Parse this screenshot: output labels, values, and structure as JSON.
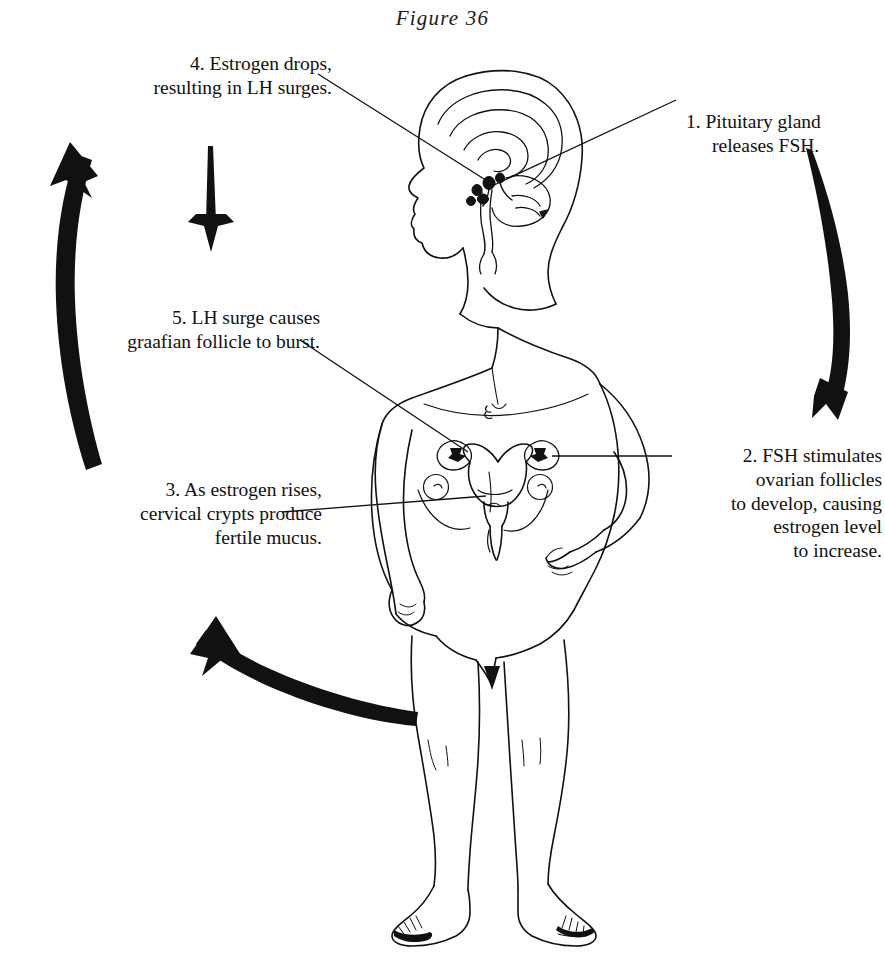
{
  "figure": {
    "title": "Figure 36",
    "background_color": "#ffffff",
    "ink_color": "#111111"
  },
  "callouts": [
    {
      "id": "callout-1",
      "number": "1.",
      "line1": "1.  Pituitary gland",
      "line2": "releases FSH.",
      "full_text": "1. Pituitary gland releases FSH.",
      "align": "left",
      "points_to": "pituitary-gland"
    },
    {
      "id": "callout-2",
      "number": "2.",
      "full_text": "2.  FSH stimulates\novarian follicles\nto develop, causing\nestrogen level\nto increase.",
      "align": "right",
      "points_to": "right-ovary"
    },
    {
      "id": "callout-3",
      "number": "3.",
      "full_text": "3.  As estrogen rises,\ncervical crypts produce\nfertile mucus.",
      "align": "right",
      "points_to": "cervix"
    },
    {
      "id": "callout-4",
      "number": "4.",
      "full_text": "4.  Estrogen drops,\nresulting in LH surges.",
      "align": "right",
      "points_to": "pituitary-gland"
    },
    {
      "id": "callout-5",
      "number": "5.",
      "full_text": "5.  LH surge causes\ngraafian follicle to burst.",
      "align": "right",
      "points_to": "left-ovary"
    }
  ],
  "cycle_arrows": [
    {
      "name": "arrow-right-descending",
      "direction": "down",
      "side": "right"
    },
    {
      "name": "arrow-bottom-left-sweeping",
      "direction": "up-left",
      "side": "bottom"
    },
    {
      "name": "arrow-left-ascending",
      "direction": "up",
      "side": "left"
    },
    {
      "name": "arrow-top-small-down",
      "direction": "down",
      "side": "top-left"
    }
  ],
  "anatomy_parts": [
    "head-profile",
    "brain-cross-section",
    "pituitary-gland",
    "torso",
    "left-arm",
    "right-arm-on-hip",
    "uterus",
    "left-ovary",
    "right-ovary",
    "cervix",
    "legs",
    "feet"
  ]
}
